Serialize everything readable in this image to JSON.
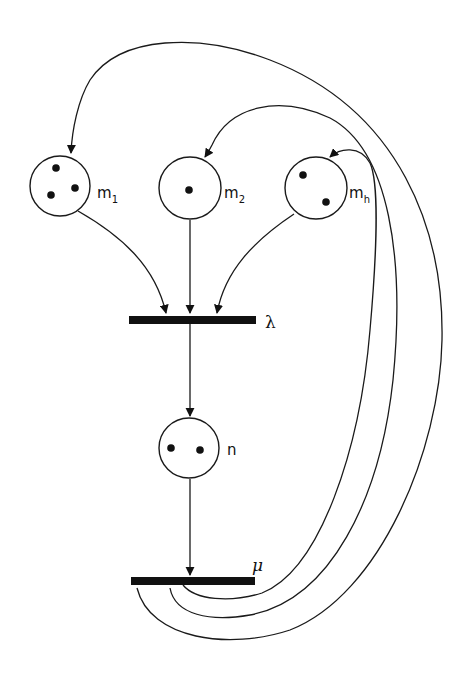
{
  "diagram": {
    "type": "petri-net",
    "places": [
      {
        "id": "m1",
        "label": "m",
        "subscript": "1",
        "tokens": 3
      },
      {
        "id": "m2",
        "label": "m",
        "subscript": "2",
        "tokens": 1
      },
      {
        "id": "mh",
        "label": "m",
        "subscript": "h",
        "tokens": 2
      },
      {
        "id": "n",
        "label": "n",
        "subscript": "",
        "tokens": 2
      }
    ],
    "transitions": [
      {
        "id": "lambda",
        "label": "λ"
      },
      {
        "id": "mu",
        "label": "μ"
      }
    ],
    "arcs": [
      {
        "from": "m1",
        "to": "lambda"
      },
      {
        "from": "m2",
        "to": "lambda"
      },
      {
        "from": "mh",
        "to": "lambda"
      },
      {
        "from": "lambda",
        "to": "n"
      },
      {
        "from": "n",
        "to": "mu"
      },
      {
        "from": "mu",
        "to": "m1"
      },
      {
        "from": "mu",
        "to": "m2"
      },
      {
        "from": "mu",
        "to": "mh"
      }
    ],
    "colors": {
      "ink": "#111111",
      "background": "#ffffff"
    }
  }
}
